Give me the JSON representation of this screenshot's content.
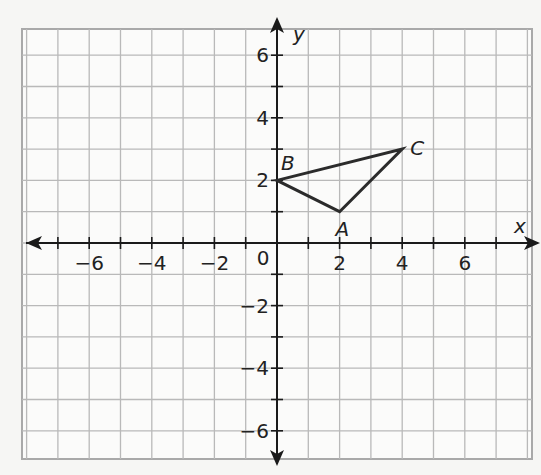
{
  "chart_data": {
    "type": "scatter",
    "title": "",
    "xlabel": "x",
    "ylabel": "y",
    "xlim": [
      -8,
      8
    ],
    "ylim": [
      -7,
      7
    ],
    "grid": true,
    "x_ticks": [
      "-6",
      "-4",
      "-2",
      "2",
      "4",
      "6"
    ],
    "y_ticks": [
      "6",
      "4",
      "2",
      "-2",
      "-4",
      "-6"
    ],
    "origin_label": "0",
    "points": [
      {
        "name": "A",
        "x": 2,
        "y": 1
      },
      {
        "name": "B",
        "x": 0,
        "y": 2
      },
      {
        "name": "C",
        "x": 4,
        "y": 3
      }
    ],
    "polygon": [
      "A",
      "B",
      "C"
    ]
  }
}
